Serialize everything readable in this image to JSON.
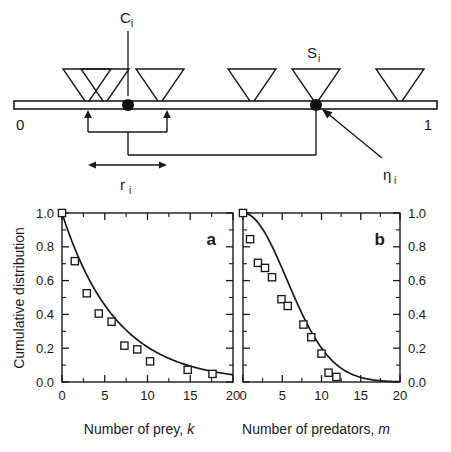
{
  "figure": {
    "background": "#ffffff",
    "ink": "#1a1a1a"
  },
  "diagram": {
    "name": "niche-interval-schematic",
    "axis_label_left": "0",
    "axis_label_right": "1",
    "labels": {
      "center": "C",
      "center_sub": "i",
      "species": "S",
      "species_sub": "i",
      "eta": "η",
      "eta_sub": "i",
      "range": "r",
      "range_sub": "i"
    },
    "triangles": [
      {
        "name": "triangle-1",
        "cx": 87,
        "half_width": 24,
        "height": 32
      },
      {
        "name": "triangle-2",
        "cx": 105,
        "half_width": 24,
        "height": 32
      },
      {
        "name": "triangle-3",
        "cx": 160,
        "half_width": 24,
        "height": 32
      },
      {
        "name": "triangle-4",
        "cx": 252,
        "half_width": 24,
        "height": 32
      },
      {
        "name": "triangle-5",
        "cx": 316,
        "half_width": 24,
        "height": 32
      },
      {
        "name": "triangle-6",
        "cx": 400,
        "half_width": 24,
        "height": 32
      }
    ],
    "dots": [
      {
        "name": "center-dot",
        "cx": 128,
        "cy": 105,
        "r": 6
      },
      {
        "name": "species-dot",
        "cx": 316,
        "cy": 105,
        "r": 6
      }
    ],
    "line": {
      "x1": 14,
      "x2": 437,
      "y": 105
    }
  },
  "chart_data": [
    {
      "type": "scatter",
      "panel": "a",
      "title": "a",
      "xlabel": "Number of prey, k",
      "xlabel_text": "Number of prey,",
      "xlabel_var": "k",
      "ylabel": "Cumulative distribution",
      "xlim": [
        0,
        20
      ],
      "ylim": [
        0,
        1.0
      ],
      "xticks": [
        0,
        5,
        10,
        15,
        20
      ],
      "xticklabels": [
        "0",
        "5",
        "10",
        "15",
        "20"
      ],
      "yticks": [
        0.0,
        0.2,
        0.4,
        0.6,
        0.8,
        1.0
      ],
      "yticklabels": [
        "0.0",
        "0.2",
        "0.4",
        "0.6",
        "0.8",
        "1.0"
      ],
      "ylabel_side": "left",
      "grid": false,
      "marker": "open-square",
      "points": [
        {
          "x": 0.0,
          "y": 1.0
        },
        {
          "x": 1.5,
          "y": 0.715
        },
        {
          "x": 2.9,
          "y": 0.525
        },
        {
          "x": 4.3,
          "y": 0.405
        },
        {
          "x": 5.8,
          "y": 0.357
        },
        {
          "x": 7.3,
          "y": 0.215
        },
        {
          "x": 8.8,
          "y": 0.193
        },
        {
          "x": 10.3,
          "y": 0.122
        },
        {
          "x": 14.7,
          "y": 0.072
        },
        {
          "x": 17.6,
          "y": 0.048
        }
      ],
      "curve": {
        "name": "exponential-fit",
        "form": "exp(-x/6.35)",
        "decay": 6.35,
        "amplitude": 1.0
      }
    },
    {
      "type": "scatter",
      "panel": "b",
      "title": "b",
      "xlabel": "Number of predators, m",
      "xlabel_text": "Number of predators,",
      "xlabel_var": "m",
      "ylabel": "Cumulative distribution",
      "xlim": [
        0,
        20
      ],
      "ylim": [
        0,
        1.0
      ],
      "xticks": [
        0,
        5,
        10,
        15,
        20
      ],
      "xticklabels": [
        "0",
        "5",
        "10",
        "15",
        "20"
      ],
      "yticks": [
        0.0,
        0.2,
        0.4,
        0.6,
        0.8,
        1.0
      ],
      "yticklabels": [
        "0.0",
        "0.2",
        "0.4",
        "0.6",
        "0.8",
        "1.0"
      ],
      "ylabel_side": "right",
      "grid": false,
      "marker": "open-square",
      "points": [
        {
          "x": 0.0,
          "y": 1.0
        },
        {
          "x": 0.9,
          "y": 0.845
        },
        {
          "x": 1.9,
          "y": 0.705
        },
        {
          "x": 2.8,
          "y": 0.675
        },
        {
          "x": 3.7,
          "y": 0.62
        },
        {
          "x": 4.9,
          "y": 0.49
        },
        {
          "x": 5.7,
          "y": 0.45
        },
        {
          "x": 7.7,
          "y": 0.34
        },
        {
          "x": 8.7,
          "y": 0.265
        },
        {
          "x": 10.0,
          "y": 0.168
        },
        {
          "x": 10.9,
          "y": 0.055
        },
        {
          "x": 11.9,
          "y": 0.03
        }
      ],
      "curve": {
        "name": "gaussian-fit",
        "form": "exp(-(x/7.9)^2)",
        "decay": 7.9,
        "amplitude": 1.0
      }
    }
  ]
}
